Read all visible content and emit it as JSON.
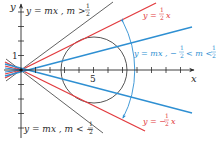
{
  "colors": {
    "axis": "#2a2a2a",
    "black_line": "#3a3a3a",
    "red": "#e23b3f",
    "blue": "#2e8fd2",
    "circle": "#2a2a2a"
  },
  "axes": {
    "x_label": "x",
    "y_label": "y",
    "x_tick_label": "5",
    "y_tick_label": "1"
  },
  "labels": {
    "upper_black": {
      "prefix": "y = mx , m >",
      "frac_num": "1",
      "frac_den": "2"
    },
    "lower_black": {
      "prefix": "y = mx , m < −",
      "frac_num": "1",
      "frac_den": "2"
    },
    "upper_red": {
      "prefix": "y =",
      "frac_num": "1",
      "frac_den": "2",
      "suffix": "x"
    },
    "lower_red": {
      "prefix": "y = −",
      "frac_num": "1",
      "frac_den": "2",
      "suffix": "x"
    },
    "blue_range": {
      "prefix": "y = mx , −",
      "frac_num": "1",
      "frac_den": "2",
      "mid": "< m <",
      "frac2_num": "1",
      "frac2_den": "2"
    }
  }
}
